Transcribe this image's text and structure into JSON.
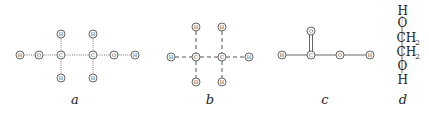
{
  "figure": {
    "panels": [
      {
        "id": "a",
        "caption": "a",
        "bond_style": "dotted",
        "atoms": [
          {
            "label": "H",
            "x": 20,
            "y": 55
          },
          {
            "label": "O",
            "x": 39,
            "y": 55
          },
          {
            "label": "C",
            "x": 61,
            "y": 55
          },
          {
            "label": "C",
            "x": 93,
            "y": 55
          },
          {
            "label": "O",
            "x": 114,
            "y": 55
          },
          {
            "label": "H",
            "x": 135,
            "y": 55
          },
          {
            "label": "H",
            "x": 61,
            "y": 34
          },
          {
            "label": "H",
            "x": 61,
            "y": 78
          },
          {
            "label": "H",
            "x": 93,
            "y": 34
          },
          {
            "label": "H",
            "x": 93,
            "y": 78
          }
        ]
      },
      {
        "id": "b",
        "caption": "b",
        "bond_style": "dashed",
        "atoms": [
          {
            "label": "H",
            "x": 171,
            "y": 57
          },
          {
            "label": "C",
            "x": 196,
            "y": 57
          },
          {
            "label": "C",
            "x": 222,
            "y": 57
          },
          {
            "label": "H",
            "x": 249,
            "y": 57
          },
          {
            "label": "H",
            "x": 196,
            "y": 27
          },
          {
            "label": "H",
            "x": 196,
            "y": 82
          },
          {
            "label": "H",
            "x": 222,
            "y": 27
          },
          {
            "label": "H",
            "x": 222,
            "y": 82
          }
        ]
      },
      {
        "id": "c",
        "caption": "c",
        "bond_style": "solid",
        "atoms": [
          {
            "label": "H",
            "x": 282,
            "y": 55
          },
          {
            "label": "C",
            "x": 311,
            "y": 55
          },
          {
            "label": "O",
            "x": 340,
            "y": 55
          },
          {
            "label": "H",
            "x": 370,
            "y": 55
          },
          {
            "label": "O",
            "x": 311,
            "y": 31
          }
        ]
      },
      {
        "id": "d",
        "caption": "d",
        "formula_lines": [
          {
            "main": "H",
            "sub": ""
          },
          {
            "main": "O",
            "sub": ""
          },
          {
            "main": "CH",
            "sub": "2"
          },
          {
            "main": "CH",
            "sub": "2"
          },
          {
            "main": "O",
            "sub": ""
          },
          {
            "main": "H",
            "sub": ""
          }
        ]
      }
    ]
  }
}
